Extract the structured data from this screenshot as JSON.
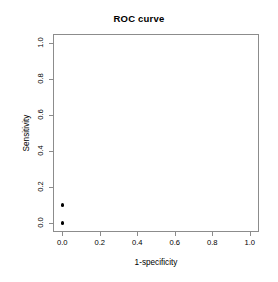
{
  "chart_data": {
    "type": "scatter",
    "title": "ROC curve",
    "xlabel": "1-specificity",
    "ylabel": "Sensitivity",
    "xlim": [
      0.0,
      1.0
    ],
    "ylim": [
      0.0,
      1.0
    ],
    "grid": false,
    "legend": null,
    "xticks": [
      "0.0",
      "0.2",
      "0.4",
      "0.6",
      "0.8",
      "1.0"
    ],
    "xtick_values": [
      0.0,
      0.2,
      0.4,
      0.6,
      0.8,
      1.0
    ],
    "yticks": [
      "0.0",
      "0.2",
      "0.4",
      "0.6",
      "0.8",
      "1.0"
    ],
    "ytick_values": [
      0.0,
      0.2,
      0.4,
      0.6,
      0.8,
      1.0
    ],
    "series": [
      {
        "name": "ROC points",
        "marker": "filled-circle",
        "color": "#000000",
        "x": [
          0.0,
          0.0
        ],
        "y": [
          0.0,
          0.1
        ]
      }
    ],
    "points": [
      {
        "x": 0.0,
        "y": 0.0
      },
      {
        "x": 0.0,
        "y": 0.1
      }
    ]
  },
  "style": {
    "frame_color": "#8c8c8c",
    "point_color": "#000000",
    "background": "#ffffff",
    "text_color": "#000000"
  }
}
